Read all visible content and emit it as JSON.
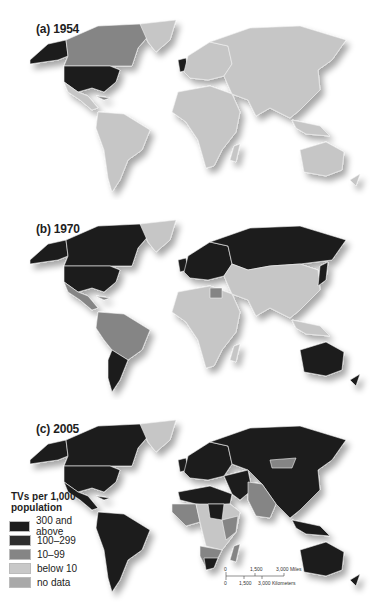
{
  "figure": {
    "panels": [
      {
        "id": "a",
        "label": "(a) 1954"
      },
      {
        "id": "b",
        "label": "(b) 1970"
      },
      {
        "id": "c",
        "label": "(c) 2005"
      }
    ]
  },
  "legend": {
    "title_line1": "TVs per 1,000",
    "title_line2": "population",
    "items": [
      {
        "label": "300 and above",
        "color": "#1c1c1c"
      },
      {
        "label": "100–299",
        "color": "#2e2e2e"
      },
      {
        "label": "10–99",
        "color": "#858585"
      },
      {
        "label": "below 10",
        "color": "#c8c8c8"
      },
      {
        "label": "no data",
        "color": "#a9a9a9"
      }
    ]
  },
  "scale_bar": {
    "miles_ticks": [
      "0",
      "1,500",
      "3,000 Miles"
    ],
    "km_ticks": [
      "0",
      "1,500",
      "3,000 Kilometers"
    ]
  },
  "colors": {
    "dark": "#1f1f1f",
    "mid": "#858585",
    "light": "#c6c6c6",
    "nodata": "#a9a9a9",
    "border": "#f2f2f2"
  }
}
